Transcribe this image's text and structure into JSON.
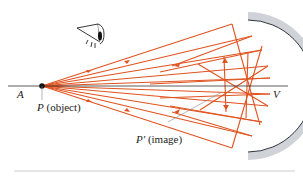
{
  "figure": {
    "labels": {
      "axis_point": "A",
      "object_letter": "P",
      "object_suffix": " (object)",
      "image_letter": "P′",
      "image_suffix": " (image)",
      "vertex": "V"
    },
    "icons": {
      "eye": "eye-icon"
    },
    "colors": {
      "ray": "#e0531f",
      "mirror_fill": "#cfd2d6",
      "mirror_edge": "#2e3440",
      "axis": "#333333",
      "leader": "#888888"
    },
    "geometry": {
      "axis_y": 86,
      "object_x": 42,
      "mirror_center_x": 192,
      "mirror_radius": 70
    }
  }
}
